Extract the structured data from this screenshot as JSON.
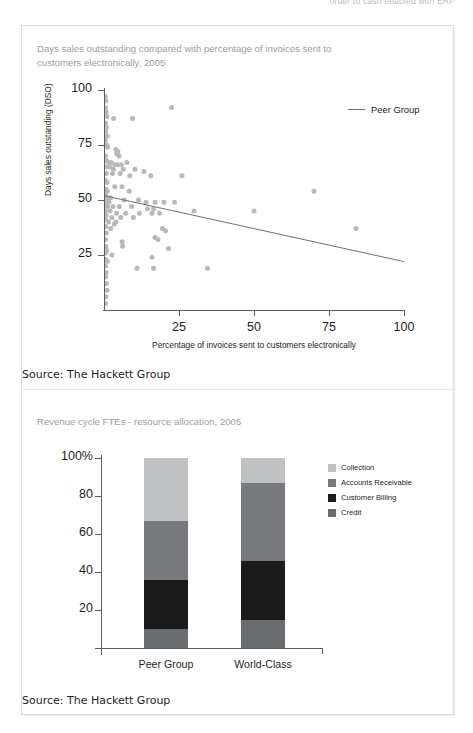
{
  "running_head": "order to cash enabled with ERP",
  "source_note": "Source: The Hackett Group",
  "colors": {
    "dot": "#b6b8ba",
    "trend_line": "#6f7275",
    "axis": "#5b5f62",
    "title_text": "#9a9ea1",
    "frame": "#dcdddf",
    "collection": "#c0c2c4",
    "accounts_receivable": "#77797c",
    "customer_billing": "#1b1b1b",
    "credit": "#6a6d70"
  },
  "scatter": {
    "title": "Days sales outstanding compared with percentage of invoices sent to customers electronically, 2005",
    "legend_label": "Peer Group",
    "chart_data": {
      "type": "scatter",
      "title": "Days sales outstanding compared with percentage of invoices sent to customers electronically, 2005",
      "xlabel": "Percentage of invoices sent to customers electronically",
      "ylabel": "Days sales outstanding (DSO)",
      "xlim": [
        0,
        100
      ],
      "ylim": [
        0,
        100
      ],
      "xticks": [
        25,
        50,
        75,
        100
      ],
      "yticks": [
        25,
        50,
        75,
        100
      ],
      "xtick_labels": [
        "25",
        "50",
        "75",
        "100"
      ],
      "ytick_labels": [
        "25",
        "50",
        "75",
        "100"
      ],
      "grid": false,
      "legend": [
        {
          "name": "Peer Group",
          "marker": "line"
        }
      ],
      "trend_line": {
        "x": [
          0,
          100
        ],
        "y": [
          52,
          22
        ]
      },
      "series": [
        {
          "name": "Peer Group",
          "points": [
            [
              0.4,
              97
            ],
            [
              0.6,
              95
            ],
            [
              0.5,
              92
            ],
            [
              0.7,
              90
            ],
            [
              1.0,
              88
            ],
            [
              3.2,
              87
            ],
            [
              9.5,
              87
            ],
            [
              22.5,
              92
            ],
            [
              0.5,
              85
            ],
            [
              0.8,
              83
            ],
            [
              0.6,
              81
            ],
            [
              1.1,
              79
            ],
            [
              0.4,
              77
            ],
            [
              0.9,
              75
            ],
            [
              1.2,
              74
            ],
            [
              4.0,
              73
            ],
            [
              4.6,
              72
            ],
            [
              4.2,
              71
            ],
            [
              5.0,
              70
            ],
            [
              0.5,
              70
            ],
            [
              0.8,
              68
            ],
            [
              1.4,
              67
            ],
            [
              2.4,
              67
            ],
            [
              3.6,
              66
            ],
            [
              4.6,
              66
            ],
            [
              5.8,
              66
            ],
            [
              7.6,
              67
            ],
            [
              0.6,
              65
            ],
            [
              1.9,
              65
            ],
            [
              3.1,
              64
            ],
            [
              6.4,
              64
            ],
            [
              10.3,
              64
            ],
            [
              13.3,
              63
            ],
            [
              0.7,
              62
            ],
            [
              2.8,
              62
            ],
            [
              5.4,
              62
            ],
            [
              8.6,
              61
            ],
            [
              15.6,
              61
            ],
            [
              0.5,
              59
            ],
            [
              1.0,
              58
            ],
            [
              3.6,
              56
            ],
            [
              6.0,
              56
            ],
            [
              0.6,
              55
            ],
            [
              1.1,
              54
            ],
            [
              8.4,
              54
            ],
            [
              0.5,
              52
            ],
            [
              1.3,
              51
            ],
            [
              2.2,
              51
            ],
            [
              6.7,
              50
            ],
            [
              0.4,
              50
            ],
            [
              0.9,
              49
            ],
            [
              1.6,
              49
            ],
            [
              11.5,
              50
            ],
            [
              14.0,
              49
            ],
            [
              17.0,
              49
            ],
            [
              20.0,
              49
            ],
            [
              23.5,
              49
            ],
            [
              0.6,
              47
            ],
            [
              1.2,
              47
            ],
            [
              3.0,
              47
            ],
            [
              5.1,
              47
            ],
            [
              9.2,
              47
            ],
            [
              14.5,
              46
            ],
            [
              16.5,
              46
            ],
            [
              0.5,
              45
            ],
            [
              2.0,
              45
            ],
            [
              4.2,
              44
            ],
            [
              7.2,
              44
            ],
            [
              11.8,
              44
            ],
            [
              16.0,
              44
            ],
            [
              18.5,
              44
            ],
            [
              30.0,
              45
            ],
            [
              0.7,
              43
            ],
            [
              2.6,
              42
            ],
            [
              5.6,
              42
            ],
            [
              9.8,
              42
            ],
            [
              50.0,
              45
            ],
            [
              0.5,
              41
            ],
            [
              1.5,
              40
            ],
            [
              4.0,
              40
            ],
            [
              3.4,
              39
            ],
            [
              0.6,
              38
            ],
            [
              2.2,
              37
            ],
            [
              19.5,
              37
            ],
            [
              20.5,
              36
            ],
            [
              84.0,
              37
            ],
            [
              0.8,
              35
            ],
            [
              17.0,
              33
            ],
            [
              18.0,
              32
            ],
            [
              0.5,
              32
            ],
            [
              6.0,
              31
            ],
            [
              6.2,
              29
            ],
            [
              0.6,
              29
            ],
            [
              21.5,
              28
            ],
            [
              0.9,
              27
            ],
            [
              0.5,
              26
            ],
            [
              2.6,
              25
            ],
            [
              16.0,
              24
            ],
            [
              0.6,
              23
            ],
            [
              1.1,
              22
            ],
            [
              0.5,
              20
            ],
            [
              11.0,
              19
            ],
            [
              16.5,
              19
            ],
            [
              34.5,
              19
            ],
            [
              0.7,
              17
            ],
            [
              0.5,
              15
            ],
            [
              0.8,
              12
            ],
            [
              1.0,
              9
            ],
            [
              0.6,
              6
            ],
            [
              0.5,
              3
            ],
            [
              70.0,
              54
            ],
            [
              26.0,
              61
            ]
          ]
        }
      ]
    }
  },
  "bar": {
    "title": "Revenue cycle FTEs - resource allocation, 2005",
    "chart_data": {
      "type": "bar",
      "stacked": true,
      "title": "Revenue cycle FTEs - resource allocation, 2005",
      "xlabel": "",
      "ylabel": "",
      "categories": [
        "Peer Group",
        "World-Class"
      ],
      "ylim": [
        0,
        100
      ],
      "yticks": [
        20,
        40,
        60,
        80,
        100
      ],
      "ytick_labels": [
        "20",
        "40",
        "60",
        "80",
        "100%"
      ],
      "grid": false,
      "legend_position": "right",
      "series": [
        {
          "name": "Collection",
          "color": "#c0c2c4",
          "values": [
            33,
            13
          ]
        },
        {
          "name": "Accounts Receivable",
          "color": "#77797c",
          "values": [
            31,
            41
          ]
        },
        {
          "name": "Customer Billing",
          "color": "#1b1b1b",
          "values": [
            26,
            31
          ]
        },
        {
          "name": "Credit",
          "color": "#6a6d70",
          "values": [
            10,
            15
          ]
        }
      ]
    },
    "legend": [
      {
        "label": "Collection",
        "color": "#c0c2c4"
      },
      {
        "label": "Accounts Receivable",
        "color": "#77797c"
      },
      {
        "label": "Customer Billing",
        "color": "#1b1b1b"
      },
      {
        "label": "Credit",
        "color": "#6a6d70"
      }
    ]
  }
}
